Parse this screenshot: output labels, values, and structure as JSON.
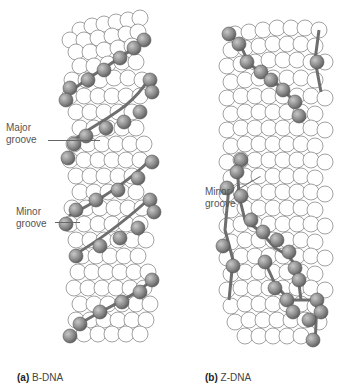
{
  "figure": {
    "panels": [
      {
        "id": "a",
        "letter": "(a)",
        "name": "B-DNA",
        "annotations": [
          {
            "text_line1": "Major",
            "text_line2": "groove"
          },
          {
            "text_line1": "Minor",
            "text_line2": "groove"
          }
        ]
      },
      {
        "id": "b",
        "letter": "(b)",
        "name": "Z-DNA",
        "annotations": [
          {
            "text_line1": "Minor",
            "text_line2": "groove"
          }
        ]
      }
    ],
    "colors": {
      "atom_fill": "#ffffff",
      "atom_stroke": "#7a7a7a",
      "backbone_atom": "#8c8c8c",
      "backbone_line": "#6e6e6e",
      "label_text": "#555555"
    }
  }
}
